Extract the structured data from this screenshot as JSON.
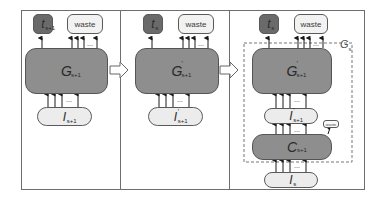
{
  "panels": [
    {
      "id": "panel-1",
      "top_outputs": {
        "t_label": "t",
        "t_sub": "s+1",
        "waste_label": "waste"
      },
      "main_node": {
        "label": "G",
        "sub": "s+1",
        "prime": ""
      },
      "input_node": {
        "label": "I",
        "sub": "s+1",
        "prime": ""
      }
    },
    {
      "id": "panel-2",
      "top_outputs": {
        "t_label": "t",
        "t_sub": "s",
        "waste_label": "waste"
      },
      "main_node": {
        "label": "G",
        "sub": "s+1",
        "prime": "'"
      },
      "input_node": {
        "label": "I",
        "sub": "s+1",
        "prime": "'"
      }
    },
    {
      "id": "panel-3",
      "top_outputs": {
        "t_label": "t",
        "t_sub": "s",
        "waste_label": "waste"
      },
      "main_node": {
        "label": "G",
        "sub": "s+1",
        "prime": "'"
      },
      "middle_node": {
        "label": "I",
        "sub": "s+1",
        "prime": "'"
      },
      "compress_node": {
        "label": "C",
        "sub": "s+1"
      },
      "side_waste_label": "waste",
      "input_node": {
        "label": "I",
        "sub": "s",
        "prime": ""
      },
      "group_label": {
        "label": "G",
        "sub": "s"
      }
    }
  ],
  "ellipsis": "...",
  "colors": {
    "dark_node": "#6a6a6a",
    "big_node": "#8e8e8e",
    "light_node": "#ececec",
    "border": "#5a5a5a",
    "frame": "#6e6e6e"
  }
}
